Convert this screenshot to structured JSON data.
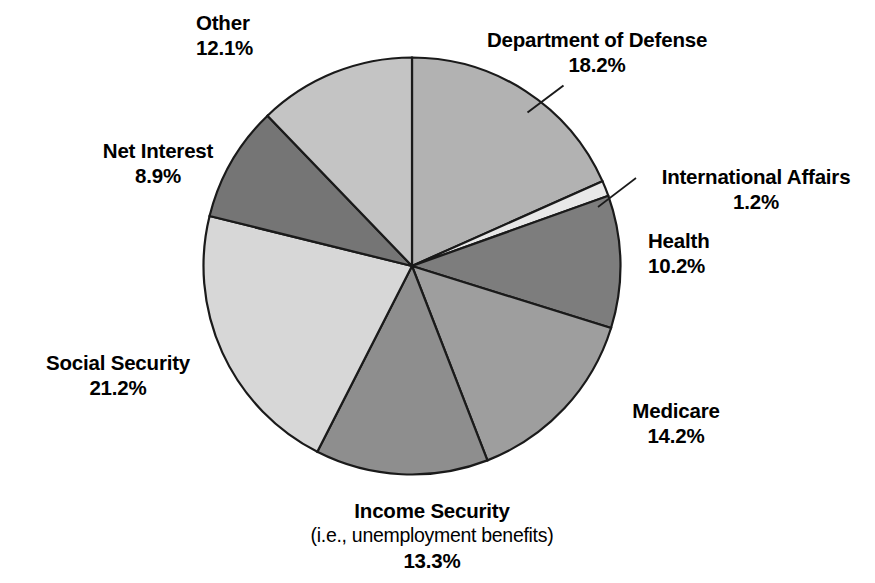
{
  "chart_data": {
    "type": "pie",
    "title": "",
    "subtitle": "",
    "xlabel": "",
    "ylabel": "",
    "legend_position": "none",
    "grid": false,
    "units": "percent",
    "start_angle_deg": 0,
    "direction": "clockwise",
    "categories": [
      "Department of Defense",
      "International Affairs",
      "Health",
      "Medicare",
      "Income Security",
      "Social Security",
      "Net Interest",
      "Other"
    ],
    "values": [
      18.2,
      1.2,
      10.2,
      14.2,
      13.3,
      21.2,
      8.9,
      12.1
    ],
    "slices": [
      {
        "name": "department-of-defense",
        "label": "Department of Defense",
        "value": 18.2,
        "value_text": "18.2%",
        "color": "#b2b2b2",
        "has_leader_line": true
      },
      {
        "name": "international-affairs",
        "label": "International Affairs",
        "value": 1.2,
        "value_text": "1.2%",
        "color": "#e8e8e8",
        "has_leader_line": true
      },
      {
        "name": "health",
        "label": "Health",
        "value": 10.2,
        "value_text": "10.2%",
        "color": "#7d7d7d",
        "has_leader_line": false
      },
      {
        "name": "medicare",
        "label": "Medicare",
        "value": 14.2,
        "value_text": "14.2%",
        "color": "#9e9e9e",
        "has_leader_line": false
      },
      {
        "name": "income-security",
        "label": "Income Security",
        "sublabel": "(i.e., unemployment benefits)",
        "value": 13.3,
        "value_text": "13.3%",
        "color": "#8e8e8e",
        "has_leader_line": false
      },
      {
        "name": "social-security",
        "label": "Social Security",
        "value": 21.2,
        "value_text": "21.2%",
        "color": "#d7d7d7",
        "has_leader_line": false
      },
      {
        "name": "net-interest",
        "label": "Net Interest",
        "value": 8.9,
        "value_text": "8.9%",
        "color": "#757575",
        "has_leader_line": false
      },
      {
        "name": "other",
        "label": "Other",
        "value": 12.1,
        "value_text": "12.1%",
        "color": "#c4c4c4",
        "has_leader_line": false
      }
    ]
  },
  "labels": {
    "other": {
      "name": "Other",
      "value": "12.1%"
    },
    "department_of_defense": {
      "name": "Department of Defense",
      "value": "18.2%"
    },
    "international_affairs": {
      "name": "International Affairs",
      "value": "1.2%"
    },
    "health": {
      "name": "Health",
      "value": "10.2%"
    },
    "medicare": {
      "name": "Medicare",
      "value": "14.2%"
    },
    "income_security": {
      "name": "Income Security",
      "sub": "(i.e., unemployment benefits)",
      "value": "13.3%"
    },
    "social_security": {
      "name": "Social Security",
      "value": "21.2%"
    },
    "net_interest": {
      "name": "Net Interest",
      "value": "8.9%"
    }
  },
  "colors": {
    "background": "#ffffff",
    "outline": "#1a1a1a",
    "text": "#000000"
  }
}
